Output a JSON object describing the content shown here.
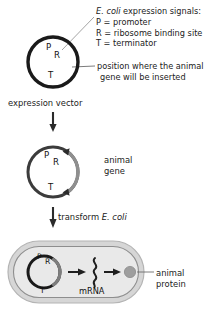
{
  "figure": {
    "background_color": "#ffffff",
    "ink_color": "#222222"
  },
  "legend": {
    "heading_italic": "E. coli",
    "heading_rest": " expression signals:",
    "entries": [
      {
        "key": "P",
        "text": "P = promoter"
      },
      {
        "key": "R",
        "text": "R = ribosome binding site"
      },
      {
        "key": "T",
        "text": "T = terminator"
      }
    ]
  },
  "callouts": {
    "insert_site_line1": "position where the animal",
    "insert_site_line2": "gene will be inserted"
  },
  "stage1": {
    "caption": "expression vector",
    "ring_labels": {
      "p": "P",
      "r": "R",
      "t": "T"
    },
    "ring_color": "#1a1a1a"
  },
  "stage2": {
    "ring_labels": {
      "p": "P",
      "r": "R",
      "t": "T"
    },
    "gene_label_line1": "animal",
    "gene_label_line2": "gene",
    "gene_arc_color": "#8f8f8f",
    "ring_color": "#3c3c3c"
  },
  "stage3": {
    "arrow_label_plain": "transform ",
    "arrow_label_italic": "E. coli",
    "cell_fill": "#d9d9d9",
    "cell_inner_fill": "#e8e8e8",
    "cell_outline": "#9a9a9a",
    "ring_labels": {
      "p": "P",
      "r": "R",
      "t": "T"
    },
    "mrna_label": "mRNA",
    "protein_label_line1": "animal",
    "protein_label_line2": "protein",
    "protein_color": "#9e9e9e"
  }
}
